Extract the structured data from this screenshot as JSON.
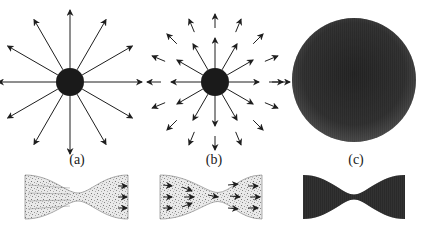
{
  "figure": {
    "panels": [
      {
        "id": "a",
        "label": "(a)",
        "description": "Central dark sphere with 12 uniform radial outward arrows",
        "sphere": {
          "cx": 70,
          "cy": 82,
          "r": 14
        },
        "arrow_count": 12,
        "arrow_length": 58
      },
      {
        "id": "b",
        "label": "(b)",
        "description": "Central dark sphere with 12 inner radial arrows and 16 outer detached arrows",
        "sphere": {
          "cx": 215,
          "cy": 82,
          "r": 14
        },
        "inner_arrow_count": 12,
        "outer_arrow_count": 16
      },
      {
        "id": "c",
        "label": "(c)",
        "description": "Large densely shaded sphere",
        "sphere": {
          "cx": 354,
          "cy": 80,
          "r": 62
        }
      }
    ],
    "bottom_row": [
      {
        "id": "a",
        "shape": "hourglass-nozzle",
        "fill": "light-speckled",
        "arrows_right": 3
      },
      {
        "id": "b",
        "shape": "hourglass-nozzle",
        "fill": "speckled-with-arrows",
        "arrows": 10
      },
      {
        "id": "c",
        "shape": "hourglass-nozzle",
        "fill": "dense-dark"
      }
    ],
    "colors": {
      "ink": "#1e1e1e",
      "sphere": "#1a1a1a",
      "dense": "#2a2a2a",
      "speckle": "#8a8a8a"
    }
  }
}
